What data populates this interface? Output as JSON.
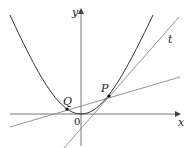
{
  "diagram": {
    "type": "function-graph",
    "curve": "parabola",
    "axes": {
      "x_label": "x",
      "y_label": "y",
      "origin_label": "0"
    },
    "points": [
      {
        "name": "P",
        "label": "P"
      },
      {
        "name": "Q",
        "label": "Q"
      }
    ],
    "lines": [
      {
        "name": "tangent",
        "label": "t",
        "through": [
          "P"
        ]
      },
      {
        "name": "secant",
        "label": "",
        "through": [
          "Q",
          "P"
        ]
      }
    ],
    "colors": {
      "curve": "#333333",
      "lines": "#888888",
      "axes": "#444444",
      "points": "#111111"
    }
  }
}
